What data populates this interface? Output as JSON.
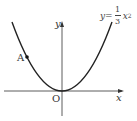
{
  "diagram": {
    "type": "function-graph",
    "equation": {
      "lhs": "y",
      "equals": "=",
      "numerator": "1",
      "denominator": "3",
      "term": "x",
      "exponent": "2"
    },
    "axes": {
      "x_label": "x",
      "y_label": "y",
      "origin_label": "O"
    },
    "points": [
      {
        "label": "A"
      }
    ],
    "colors": {
      "curve": "#222222",
      "axes": "#333333"
    }
  }
}
